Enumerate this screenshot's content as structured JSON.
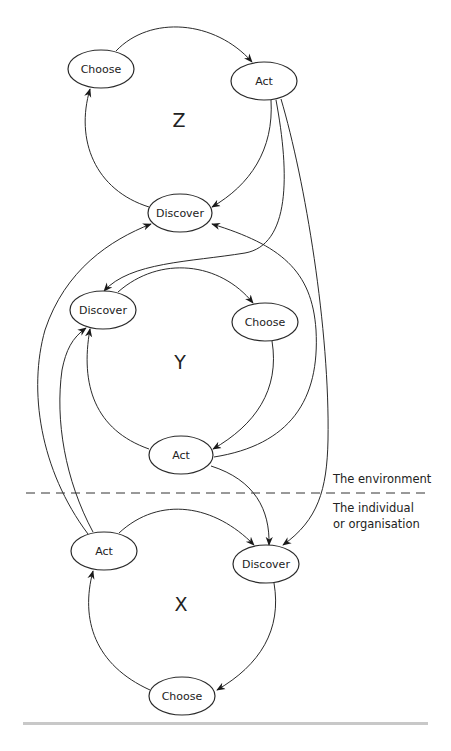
{
  "diagram": {
    "loops": [
      {
        "id": "Z",
        "label": "Z",
        "nodes": {
          "choose": "Choose",
          "act": "Act",
          "discover": "Discover"
        }
      },
      {
        "id": "Y",
        "label": "Y",
        "nodes": {
          "discover": "Discover",
          "choose": "Choose",
          "act": "Act"
        }
      },
      {
        "id": "X",
        "label": "X",
        "nodes": {
          "act": "Act",
          "discover": "Discover",
          "choose": "Choose"
        }
      }
    ],
    "zones": {
      "environment": "The environment",
      "individual_line1": "The individual",
      "individual_line2": "or organisation"
    },
    "edges": [
      {
        "from": "Z.choose",
        "to": "Z.act"
      },
      {
        "from": "Z.act",
        "to": "Z.discover"
      },
      {
        "from": "Z.discover",
        "to": "Z.choose"
      },
      {
        "from": "Y.discover",
        "to": "Y.choose"
      },
      {
        "from": "Y.choose",
        "to": "Y.act"
      },
      {
        "from": "Y.act",
        "to": "Y.discover"
      },
      {
        "from": "X.act",
        "to": "X.discover"
      },
      {
        "from": "X.discover",
        "to": "X.choose"
      },
      {
        "from": "X.choose",
        "to": "X.act"
      },
      {
        "from": "Z.act",
        "to": "Y.discover"
      },
      {
        "from": "Z.act",
        "to": "X.discover"
      },
      {
        "from": "Y.act",
        "to": "Z.discover"
      },
      {
        "from": "Y.act",
        "to": "X.discover"
      },
      {
        "from": "X.act",
        "to": "Z.discover"
      },
      {
        "from": "X.act",
        "to": "Y.discover"
      }
    ]
  }
}
